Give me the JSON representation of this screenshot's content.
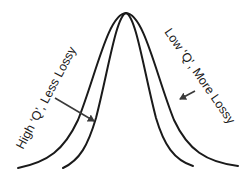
{
  "diagram": {
    "type": "resonance-curves",
    "curves": [
      {
        "name": "narrow-curve",
        "description": "inner, narrower peak"
      },
      {
        "name": "wide-curve",
        "description": "outer, wider peak"
      }
    ],
    "labels": {
      "high_q": "High ‘Q’, Less Lossy",
      "low_q": "Low ‘Q’, More Lossy"
    },
    "colors": {
      "line": "#1a1a1a",
      "arrow": "#3a3a3a",
      "background": "#ffffff"
    }
  }
}
